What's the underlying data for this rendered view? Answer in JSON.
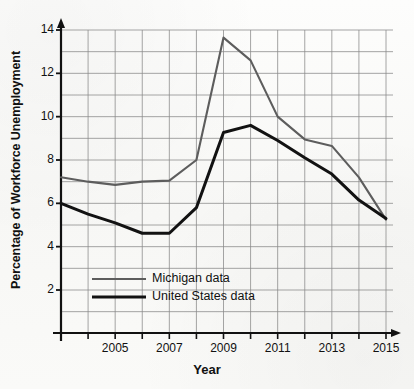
{
  "chart_data": {
    "type": "line",
    "title": "",
    "xlabel": "Year",
    "ylabel": "Percentage of Workforce Unemployment",
    "x": [
      2003,
      2004,
      2005,
      2006,
      2007,
      2008,
      2009,
      2010,
      2011,
      2012,
      2013,
      2014,
      2015
    ],
    "xlim": [
      2003,
      2015
    ],
    "ylim": [
      0,
      14
    ],
    "xticks": [
      2005,
      2007,
      2009,
      2011,
      2013,
      2015
    ],
    "xtick_labels": [
      "2005",
      "2007",
      "2009",
      "2011",
      "2013",
      "2015"
    ],
    "yticks": [
      2,
      4,
      6,
      8,
      10,
      12,
      14
    ],
    "ytick_labels": [
      "2",
      "4",
      "6",
      "8",
      "10",
      "12",
      "14"
    ],
    "grid": true,
    "grid_color": "#8a8a8a",
    "legend_position": "inside-lower-left",
    "series": [
      {
        "name": "Michigan data",
        "legend_label": "Michigan data",
        "color": "#5d5d5d",
        "width": 2.1,
        "values": [
          7.2,
          7.0,
          6.85,
          7.0,
          7.05,
          8.0,
          13.65,
          12.6,
          10.0,
          8.95,
          8.65,
          7.2,
          5.25
        ]
      },
      {
        "name": "United States data",
        "legend_label": "United States data",
        "color": "#121212",
        "width": 3.0,
        "values": [
          6.0,
          5.5,
          5.1,
          4.62,
          4.62,
          5.8,
          9.27,
          9.6,
          8.9,
          8.1,
          7.35,
          6.15,
          5.3
        ]
      }
    ]
  },
  "axes": {
    "x_axis_label": "Year",
    "y_axis_label": "Percentage of Workforce Unemployment"
  },
  "legend": {
    "items": [
      {
        "label": "Michigan data",
        "color": "#5d5d5d"
      },
      {
        "label": "United States data",
        "color": "#121212"
      }
    ]
  }
}
